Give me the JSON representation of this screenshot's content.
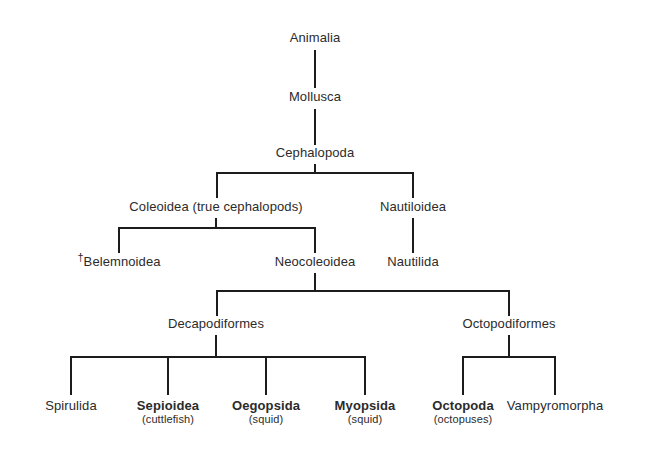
{
  "diagram": {
    "background_color": "#ffffff",
    "line_color": "#1c1c1c",
    "text_color": "#2b2b2b",
    "extinct_marker": "†"
  },
  "nodes": {
    "animalia": {
      "name": "Animalia",
      "sub": ""
    },
    "mollusca": {
      "name": "Mollusca",
      "sub": ""
    },
    "cephalopoda": {
      "name": "Cephalopoda",
      "sub": ""
    },
    "coleoidea": {
      "name": "Coleoidea (true cephalopods)",
      "sub": ""
    },
    "nautiloidea": {
      "name": "Nautiloidea",
      "sub": ""
    },
    "belemnoidea_dagger": "†",
    "belemnoidea": {
      "name": "Belemnoidea",
      "sub": ""
    },
    "neocoleoidea": {
      "name": "Neocoleoidea",
      "sub": ""
    },
    "nautilida": {
      "name": "Nautilida",
      "sub": ""
    },
    "decapodiformes": {
      "name": "Decapodiformes",
      "sub": ""
    },
    "octopodiformes": {
      "name": "Octopodiformes",
      "sub": ""
    },
    "spirulida": {
      "name": "Spirulida",
      "sub": ""
    },
    "sepioidea": {
      "name": "Sepioidea",
      "sub": "(cuttlefish)"
    },
    "oegopsida": {
      "name": "Oegopsida",
      "sub": "(squid)"
    },
    "myopsida": {
      "name": "Myopsida",
      "sub": "(squid)"
    },
    "octopoda": {
      "name": "Octopoda",
      "sub": "(octopuses)"
    },
    "vampyromorpha": {
      "name": "Vampyromorpha",
      "sub": ""
    }
  }
}
